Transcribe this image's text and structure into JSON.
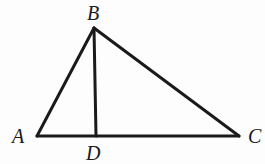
{
  "diagram": {
    "type": "triangle-with-altitude",
    "points": {
      "A": {
        "label": "A",
        "x": 37,
        "y": 136,
        "label_x": 12,
        "label_y": 143
      },
      "B": {
        "label": "B",
        "x": 94,
        "y": 28,
        "label_x": 87,
        "label_y": 20
      },
      "C": {
        "label": "C",
        "x": 239,
        "y": 136,
        "label_x": 248,
        "label_y": 143
      },
      "D": {
        "label": "D",
        "x": 96,
        "y": 136,
        "label_x": 86,
        "label_y": 160
      }
    },
    "segments": [
      {
        "from": "A",
        "to": "B"
      },
      {
        "from": "B",
        "to": "C"
      },
      {
        "from": "A",
        "to": "C"
      },
      {
        "from": "B",
        "to": "D"
      }
    ],
    "colors": {
      "stroke": "#1a1a1a",
      "background": "#fdfdfd"
    }
  }
}
